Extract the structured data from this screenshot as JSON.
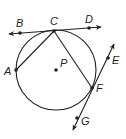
{
  "diagram": {
    "type": "circle-geometry",
    "circle": {
      "center_label": "P",
      "cx": 56,
      "cy": 70,
      "r": 40
    },
    "points": [
      {
        "label": "A",
        "x": 16,
        "y": 70
      },
      {
        "label": "B",
        "x": 20,
        "y": 33
      },
      {
        "label": "C",
        "x": 54,
        "y": 31
      },
      {
        "label": "D",
        "x": 89,
        "y": 28
      },
      {
        "label": "E",
        "x": 108,
        "y": 58
      },
      {
        "label": "F",
        "x": 92,
        "y": 88
      },
      {
        "label": "G",
        "x": 77,
        "y": 118
      },
      {
        "label": "P",
        "x": 56,
        "y": 70
      }
    ],
    "lines": [
      {
        "name": "tangent-line-BD",
        "through": [
          "B",
          "C",
          "D"
        ],
        "kind": "line"
      },
      {
        "name": "secant-line-EG",
        "through": [
          "E",
          "F",
          "G"
        ],
        "kind": "line"
      }
    ],
    "segments": [
      {
        "name": "chord-AC",
        "from": "A",
        "to": "C"
      },
      {
        "name": "chord-CF",
        "from": "C",
        "to": "F"
      }
    ],
    "labels": {
      "A": "A",
      "B": "B",
      "C": "C",
      "D": "D",
      "E": "E",
      "F": "F",
      "G": "G",
      "P": "P"
    }
  }
}
